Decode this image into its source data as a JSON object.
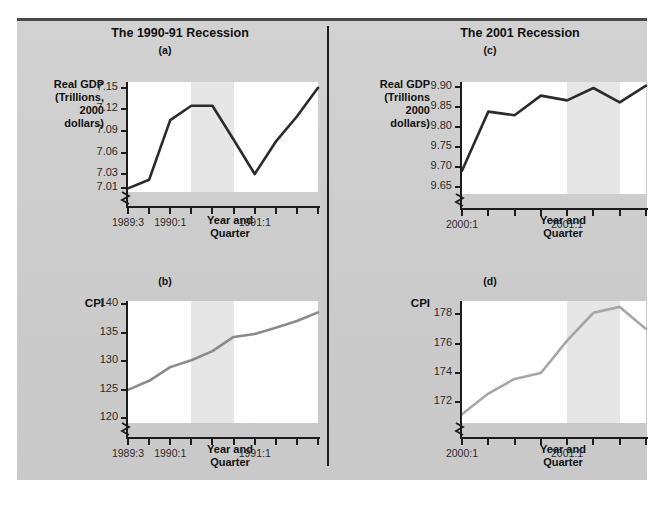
{
  "figure": {
    "background": "#cfcfcf",
    "columns": [
      {
        "title": "The 1990-91 Recession"
      },
      {
        "title": "The 2001 Recession"
      }
    ]
  },
  "chart_data": [
    {
      "id": "a",
      "panel_letter": "(a)",
      "type": "line",
      "title": "The 1990-91 Recession",
      "ylabel": "Real GDP\n(Trillions,\n2000\ndollars)",
      "ylabel_lines": [
        "Real GDP",
        "(Trillions,",
        "2000",
        "dollars)"
      ],
      "xlabel": "Year and Quarter",
      "xlabel_lines": [
        "Year and",
        "Quarter"
      ],
      "line_color": "#2b2b2b",
      "axis_break": true,
      "grid": false,
      "legend": "none",
      "yticks": [
        7.01,
        7.03,
        7.06,
        7.09,
        7.12,
        7.15
      ],
      "ytick_labels": [
        "7.01",
        "7.03",
        "7.06",
        "7.09",
        "7.12",
        "7.15"
      ],
      "ylim": [
        7.005,
        7.158
      ],
      "x_categories": [
        "1989:3",
        "1989:4",
        "1990:1",
        "1990:2",
        "1990:3",
        "1990:4",
        "1991:1",
        "1991:2",
        "1991:3",
        "1991:4"
      ],
      "xtick_labels_shown": [
        "1989:3",
        "1990:1",
        "1991:1"
      ],
      "xtick_label_indices": [
        0,
        2,
        6
      ],
      "values": [
        7.01,
        7.022,
        7.105,
        7.125,
        7.125,
        7.078,
        7.03,
        7.075,
        7.11,
        7.15
      ],
      "shaded_regions": [
        {
          "from_index": 3,
          "to_index": 5,
          "label": "recession",
          "color": "#e6e6e6"
        }
      ]
    },
    {
      "id": "b",
      "panel_letter": "(b)",
      "type": "line",
      "title": "The 1990-91 Recession",
      "ylabel": "CPI",
      "ylabel_lines": [
        "CPI"
      ],
      "xlabel": "Year and Quarter",
      "xlabel_lines": [
        "Year and",
        "Quarter"
      ],
      "line_color": "#8a8a8a",
      "axis_break": true,
      "grid": false,
      "legend": "none",
      "yticks": [
        120,
        125,
        130,
        135,
        140
      ],
      "ytick_labels": [
        "120",
        "125",
        "130",
        "135",
        "140"
      ],
      "ylim": [
        119.2,
        140.6
      ],
      "x_categories": [
        "1989:3",
        "1989:4",
        "1990:1",
        "1990:2",
        "1990:3",
        "1990:4",
        "1991:1",
        "1991:2",
        "1991:3",
        "1991:4"
      ],
      "xtick_labels_shown": [
        "1989:3",
        "1990:1",
        "1991:1"
      ],
      "xtick_label_indices": [
        0,
        2,
        6
      ],
      "values": [
        125.0,
        126.6,
        129.0,
        130.2,
        131.8,
        134.3,
        134.8,
        135.9,
        137.1,
        138.6
      ],
      "shaded_regions": [
        {
          "from_index": 3,
          "to_index": 5,
          "label": "recession",
          "color": "#e6e6e6"
        }
      ]
    },
    {
      "id": "c",
      "panel_letter": "(c)",
      "type": "line",
      "title": "The 2001 Recession",
      "ylabel": "Real GDP\n(Trillions\n2000\ndollars)",
      "ylabel_lines": [
        "Real GDP",
        "(Trillions",
        "2000",
        "dollars)"
      ],
      "xlabel": "Year and Quarter",
      "xlabel_lines": [
        "Year and",
        "Quarter"
      ],
      "line_color": "#2b2b2b",
      "axis_break": true,
      "grid": false,
      "legend": "none",
      "yticks": [
        9.65,
        9.7,
        9.75,
        9.8,
        9.85,
        9.9
      ],
      "ytick_labels": [
        "9.65",
        "9.70",
        "9.75",
        "9.80",
        "9.85",
        "9.90"
      ],
      "ylim": [
        9.632,
        9.912
      ],
      "x_categories": [
        "2000:1",
        "2000:2",
        "2000:3",
        "2000:4",
        "2001:1",
        "2001:2",
        "2001:3",
        "2001:4"
      ],
      "xtick_labels_shown": [
        "2000:1",
        "2001:1"
      ],
      "xtick_label_indices": [
        0,
        4
      ],
      "values": [
        9.69,
        9.838,
        9.829,
        9.878,
        9.866,
        9.897,
        9.861,
        9.903
      ],
      "shaded_regions": [
        {
          "from_index": 4,
          "to_index": 6,
          "label": "recession",
          "color": "#e6e6e6"
        }
      ]
    },
    {
      "id": "d",
      "panel_letter": "(d)",
      "type": "line",
      "title": "The 2001 Recession",
      "ylabel": "CPI",
      "ylabel_lines": [
        "CPI"
      ],
      "xlabel": "Year and Quarter",
      "xlabel_lines": [
        "Year and",
        "Quarter"
      ],
      "line_color": "#a6a6a6",
      "axis_break": true,
      "grid": false,
      "legend": "none",
      "yticks": [
        172,
        174,
        176,
        178
      ],
      "ytick_labels": [
        "172",
        "174",
        "176",
        "178"
      ],
      "ylim": [
        170.6,
        178.9
      ],
      "x_categories": [
        "2000:1",
        "2000:2",
        "2000:3",
        "2000:4",
        "2001:1",
        "2001:2",
        "2001:3",
        "2001:4"
      ],
      "xtick_labels_shown": [
        "2000:1",
        "2001:1"
      ],
      "xtick_label_indices": [
        0,
        4
      ],
      "values": [
        171.2,
        172.6,
        173.6,
        174.0,
        176.2,
        178.1,
        178.5,
        177.0
      ],
      "shaded_regions": [
        {
          "from_index": 4,
          "to_index": 6,
          "label": "recession",
          "color": "#e6e6e6"
        }
      ]
    }
  ]
}
